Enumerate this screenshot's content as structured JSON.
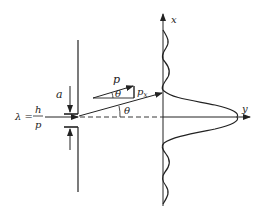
{
  "diagram": {
    "labels": {
      "lambda_lhs": "λ =",
      "lambda_num": "h",
      "lambda_den": "p",
      "slit_width": "a",
      "momentum": "p",
      "momentum_x": "p",
      "momentum_x_sub": "x",
      "angle_triangle": "θ",
      "angle_ray": "θ",
      "axis_x": "x",
      "axis_y": "y"
    },
    "colors": {
      "ink": "#222222",
      "background": "#ffffff"
    }
  }
}
